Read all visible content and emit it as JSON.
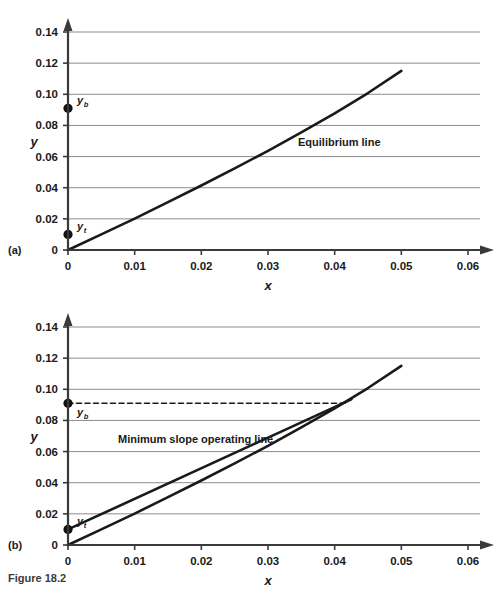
{
  "figure": {
    "caption": "Figure 18.2",
    "panels": [
      {
        "tag": "(a)"
      },
      {
        "tag": "(b)"
      }
    ]
  },
  "chart_data": [
    {
      "panel": "(a)",
      "type": "line",
      "title": "",
      "xlabel": "x",
      "ylabel": "y",
      "xlim": [
        0,
        0.06
      ],
      "ylim": [
        0,
        0.14
      ],
      "xticks": [
        "0",
        "0.01",
        "0.02",
        "0.03",
        "0.04",
        "0.05",
        "0.06"
      ],
      "xtick_values": [
        0,
        0.01,
        0.02,
        0.03,
        0.04,
        0.05,
        0.06
      ],
      "yticks": [
        "0",
        "0.02",
        "0.04",
        "0.06",
        "0.08",
        "0.10",
        "0.12",
        "0.14"
      ],
      "ytick_values": [
        0,
        0.02,
        0.04,
        0.06,
        0.08,
        0.1,
        0.12,
        0.14
      ],
      "grid": "horizontal",
      "legend": "none",
      "series": [
        {
          "name": "Equilibrium line",
          "style": "solid",
          "color": "#1a1a1a",
          "x": [
            0,
            0.005,
            0.01,
            0.015,
            0.02,
            0.025,
            0.03,
            0.035,
            0.04,
            0.045,
            0.05
          ],
          "y": [
            0,
            0.01,
            0.0202,
            0.0307,
            0.0414,
            0.0524,
            0.0637,
            0.0755,
            0.0878,
            0.1008,
            0.115
          ]
        }
      ],
      "points": [
        {
          "name": "y_b",
          "label": "y",
          "sub": "b",
          "x": 0,
          "y": 0.091
        },
        {
          "name": "y_t",
          "label": "y",
          "sub": "t",
          "x": 0,
          "y": 0.01
        }
      ],
      "annotations": [
        {
          "name": "equilibrium-line-label",
          "text": "Equilibrium line",
          "x": 0.0345,
          "y": 0.0665
        }
      ]
    },
    {
      "panel": "(b)",
      "type": "line",
      "title": "",
      "xlabel": "x",
      "ylabel": "y",
      "xlim": [
        0,
        0.06
      ],
      "ylim": [
        0,
        0.14
      ],
      "xticks": [
        "0",
        "0.01",
        "0.02",
        "0.03",
        "0.04",
        "0.05",
        "0.06"
      ],
      "xtick_values": [
        0,
        0.01,
        0.02,
        0.03,
        0.04,
        0.05,
        0.06
      ],
      "yticks": [
        "0",
        "0.02",
        "0.04",
        "0.06",
        "0.08",
        "0.10",
        "0.12",
        "0.14"
      ],
      "ytick_values": [
        0,
        0.02,
        0.04,
        0.06,
        0.08,
        0.1,
        0.12,
        0.14
      ],
      "grid": "horizontal",
      "legend": "none",
      "series": [
        {
          "name": "Equilibrium line",
          "style": "solid",
          "color": "#1a1a1a",
          "x": [
            0,
            0.005,
            0.01,
            0.015,
            0.02,
            0.025,
            0.03,
            0.035,
            0.04,
            0.045,
            0.05
          ],
          "y": [
            0,
            0.01,
            0.0202,
            0.0307,
            0.0414,
            0.0524,
            0.0637,
            0.0755,
            0.0878,
            0.1008,
            0.115
          ]
        },
        {
          "name": "Minimum slope operating line",
          "style": "solid",
          "color": "#1a1a1a",
          "x": [
            0,
            0.0425
          ],
          "y": [
            0.01,
            0.0935
          ]
        },
        {
          "name": "y_b tie line",
          "style": "dashed",
          "color": "#1a1a1a",
          "x": [
            0,
            0.0417
          ],
          "y": [
            0.091,
            0.091
          ]
        }
      ],
      "points": [
        {
          "name": "y_b",
          "label": "y",
          "sub": "b",
          "x": 0,
          "y": 0.091
        },
        {
          "name": "y_t",
          "label": "y",
          "sub": "t",
          "x": 0,
          "y": 0.01
        }
      ],
      "annotations": [
        {
          "name": "minimum-slope-operating-line-label",
          "text": "Minimum slope operating line",
          "x": 0.0075,
          "y": 0.0655
        }
      ]
    }
  ]
}
